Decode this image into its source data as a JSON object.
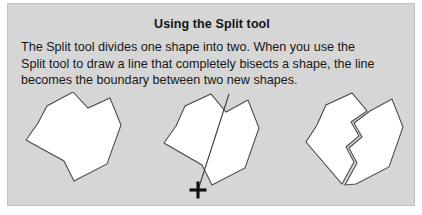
{
  "panel": {
    "title": "Using the Split tool",
    "body_lines": [
      "The Split tool divides one shape into two. When you use the",
      "Split tool to draw a line that completely bisects a shape, the line",
      "becomes the boundary between two new shapes."
    ],
    "background_color": "#d6d6d6",
    "border_color": "#c2c2c2",
    "text_color": "#161616"
  },
  "illustration": {
    "shape_fill_color": "#ffffff",
    "shape_stroke_color": "#4a4a4a",
    "split_line_color": "#3d3d3d",
    "cursor_color": "#101010",
    "steps": [
      {
        "name": "original-shape",
        "caption": "",
        "polygons": [
          {
            "name": "whole-shape",
            "points": "30,31 39,14 65,0 80,16 102,6 113,33 99,72 66,89 56,69 18,48"
          }
        ],
        "split_line": null,
        "cursor": null
      },
      {
        "name": "shape-being-split",
        "caption": "",
        "polygons": [
          {
            "name": "shape-with-cut-line",
            "points": "168,34 177,14 203,2 218,20 240,8 251,36 237,76 204,93 194,73 156,51"
          }
        ],
        "split_line": {
          "name": "split-stroke",
          "x1": 221,
          "y1": 2,
          "x2": 191,
          "y2": 95
        },
        "cursor": {
          "name": "crosshair-cursor",
          "x": 190,
          "y": 98,
          "size": 17
        }
      },
      {
        "name": "resulting-two-shapes",
        "caption": "",
        "polygons": [
          {
            "name": "left-piece",
            "points": "309,33 318,13 344,1 359,19 343,30 351,44 338,55 346,70 334,92 298,50"
          },
          {
            "name": "right-piece",
            "points": "362,19 384,7 395,35 381,75 348,92 337,93 349,71 341,56 354,45 346,31"
          }
        ],
        "split_line": null,
        "cursor": null
      }
    ]
  }
}
